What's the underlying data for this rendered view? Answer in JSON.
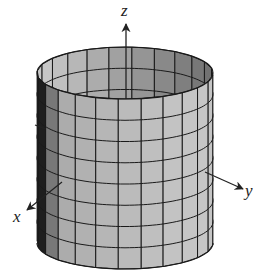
{
  "figure": {
    "type": "3d-surface-cylinder",
    "axes": {
      "x": {
        "label": "x"
      },
      "y": {
        "label": "y"
      },
      "z": {
        "label": "z"
      }
    },
    "cylinder": {
      "center_x": 125,
      "top_y": 73,
      "bottom_y": 243,
      "rx": 88,
      "ry": 26,
      "vertical_segments": 24,
      "horizontal_rings": 8
    },
    "colors": {
      "outer_face": "#b8b8b8",
      "inner_face": "#a6a6a6",
      "inner_dark": "#6e6e6e",
      "shadow_edge": "#1e1e1e",
      "grid": "#1a1a1a",
      "axis": "#222222"
    }
  }
}
